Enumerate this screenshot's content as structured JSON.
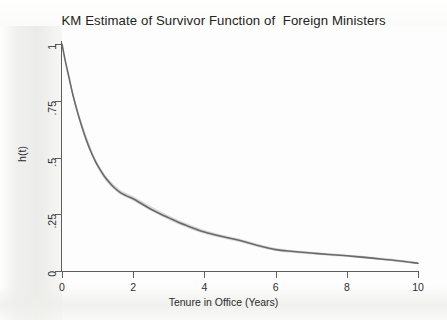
{
  "chart_data": {
    "type": "line",
    "title": "KM Estimate of Survivor Function of  Foreign Ministers",
    "xlabel": "Tenure in Office (Years)",
    "ylabel": "h(t)",
    "xlim": [
      0,
      10
    ],
    "ylim": [
      0,
      1
    ],
    "grid": false,
    "legend": "none",
    "xticks": [
      0,
      2,
      4,
      6,
      8,
      10
    ],
    "xticklabels": [
      "0",
      "2",
      "4",
      "6",
      "8",
      "10"
    ],
    "yticks": [
      0,
      0.25,
      0.5,
      0.75,
      1
    ],
    "yticklabels": [
      "0",
      ".25",
      ".5",
      ".75",
      "1"
    ],
    "line_color": "#6a6a6a",
    "band_color": "#b9b9b9",
    "series": [
      {
        "name": "KM survivor estimate",
        "x": [
          0,
          0.1,
          0.2,
          0.3,
          0.4,
          0.5,
          0.6,
          0.7,
          0.8,
          0.9,
          1.0,
          1.2,
          1.4,
          1.6,
          1.8,
          2.0,
          2.25,
          2.5,
          2.75,
          3.0,
          3.25,
          3.5,
          3.75,
          4.0,
          4.5,
          5.0,
          5.5,
          6.0,
          6.5,
          7.0,
          7.5,
          8.0,
          8.5,
          9.0,
          9.5,
          10.0
        ],
        "values": [
          1.0,
          0.92,
          0.85,
          0.78,
          0.72,
          0.665,
          0.615,
          0.57,
          0.53,
          0.495,
          0.465,
          0.415,
          0.378,
          0.35,
          0.332,
          0.318,
          0.295,
          0.272,
          0.252,
          0.234,
          0.216,
          0.2,
          0.185,
          0.172,
          0.152,
          0.134,
          0.112,
          0.094,
          0.086,
          0.079,
          0.073,
          0.067,
          0.06,
          0.052,
          0.044,
          0.034
        ]
      },
      {
        "name": "95% CI upper",
        "x": [
          0,
          0.25,
          0.5,
          1.0,
          1.5,
          2.0,
          3.0,
          4.0,
          5.0,
          6.0,
          7.0,
          8.0,
          9.0,
          10.0
        ],
        "values": [
          1.0,
          0.825,
          0.68,
          0.478,
          0.375,
          0.329,
          0.244,
          0.181,
          0.142,
          0.101,
          0.085,
          0.073,
          0.058,
          0.04
        ]
      },
      {
        "name": "95% CI lower",
        "x": [
          0,
          0.25,
          0.5,
          1.0,
          1.5,
          2.0,
          3.0,
          4.0,
          5.0,
          6.0,
          7.0,
          8.0,
          9.0,
          10.0
        ],
        "values": [
          1.0,
          0.805,
          0.655,
          0.453,
          0.353,
          0.308,
          0.225,
          0.164,
          0.127,
          0.088,
          0.073,
          0.062,
          0.047,
          0.029
        ]
      }
    ]
  },
  "figure": {
    "title": "KM Estimate of Survivor Function of  Foreign Ministers",
    "x_axis_title": "Tenure in Office (Years)",
    "y_axis_title": "h(t)",
    "x_tick_labels": [
      "0",
      "2",
      "4",
      "6",
      "8",
      "10"
    ],
    "y_tick_labels": [
      "0",
      ".25",
      ".5",
      ".75",
      "1"
    ]
  }
}
